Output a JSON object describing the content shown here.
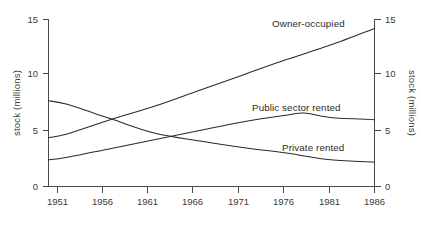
{
  "chart_data": {
    "type": "line",
    "title": "",
    "subtitle": "",
    "xlabel": "",
    "ylabel": "stock  (millions)",
    "ylabel_right": "stock  (millions)",
    "xlim": [
      1949,
      1986
    ],
    "ylim": [
      0,
      15
    ],
    "grid": false,
    "legend": "inline-annotations",
    "x_ticks": [
      "1951",
      "1956",
      "1961",
      "1966",
      "1971",
      "1976",
      "1981",
      "1986"
    ],
    "x_tick_values": [
      1951,
      1956,
      1961,
      1966,
      1971,
      1976,
      1981,
      1986
    ],
    "y_ticks": [
      "0",
      "5",
      "10",
      "15"
    ],
    "y_tick_values": [
      0,
      5,
      10,
      15
    ],
    "y_ticks_right": [
      "0",
      "5",
      "10",
      "15"
    ],
    "series": [
      {
        "name": "Owner-occupied",
        "label": "Owner-occupied",
        "x": [
          1949,
          1951,
          1956,
          1961,
          1966,
          1971,
          1976,
          1981,
          1986
        ],
        "values": [
          4.4,
          4.7,
          6.0,
          7.2,
          8.6,
          10.0,
          11.4,
          12.7,
          14.2
        ]
      },
      {
        "name": "Public sector rented",
        "label": "Public sector rented",
        "x": [
          1949,
          1951,
          1956,
          1961,
          1966,
          1971,
          1976,
          1978,
          1981,
          1986
        ],
        "values": [
          2.4,
          2.6,
          3.4,
          4.2,
          5.0,
          5.8,
          6.4,
          6.6,
          6.2,
          6.0
        ]
      },
      {
        "name": "Private rented",
        "label": "Private rented",
        "x": [
          1949,
          1951,
          1956,
          1961,
          1966,
          1971,
          1976,
          1981,
          1986
        ],
        "values": [
          7.7,
          7.4,
          6.1,
          4.8,
          4.1,
          3.5,
          3.0,
          2.4,
          2.2
        ]
      }
    ],
    "annotations": [
      {
        "text": "Owner-occupied",
        "x": 1978,
        "y": 14.2
      },
      {
        "text": "Public sector rented",
        "x": 1977,
        "y": 7.6
      },
      {
        "text": "Private rented",
        "x": 1980,
        "y": 4.1
      }
    ],
    "colors": {
      "line": "#2b2b2b",
      "axis": "#4a4a4a",
      "text": "#3a3a3a",
      "background": "#ffffff"
    }
  }
}
